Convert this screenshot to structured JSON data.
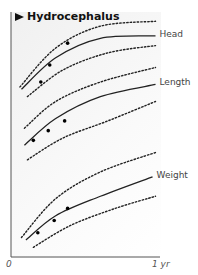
{
  "chart_data": {
    "type": "line",
    "title": "Hydrocephalus",
    "xlabel": "",
    "ylabel": "",
    "xlim": [
      0,
      1
    ],
    "ylim": [
      0,
      100
    ],
    "x_ticks": [
      "0",
      "1 yr"
    ],
    "grid": false,
    "series": [
      {
        "name": "Head",
        "label": "Head",
        "median": [
          [
            0.07,
            69
          ],
          [
            0.3,
            82
          ],
          [
            0.6,
            90
          ],
          [
            0.97,
            91
          ]
        ],
        "upper": [
          [
            0.06,
            70
          ],
          [
            0.3,
            86
          ],
          [
            0.6,
            95
          ],
          [
            0.97,
            97
          ]
        ],
        "lower": [
          [
            0.11,
            66
          ],
          [
            0.35,
            77
          ],
          [
            0.65,
            84
          ],
          [
            0.97,
            87
          ]
        ],
        "points": [
          [
            0.2,
            72
          ],
          [
            0.26,
            79
          ],
          [
            0.38,
            88
          ]
        ]
      },
      {
        "name": "Length",
        "label": "Length",
        "median": [
          [
            0.09,
            46
          ],
          [
            0.3,
            57
          ],
          [
            0.6,
            66
          ],
          [
            0.97,
            71
          ]
        ],
        "upper": [
          [
            0.09,
            53
          ],
          [
            0.3,
            64
          ],
          [
            0.6,
            72
          ],
          [
            0.97,
            78
          ]
        ],
        "lower": [
          [
            0.11,
            40
          ],
          [
            0.35,
            49
          ],
          [
            0.65,
            56
          ],
          [
            0.97,
            64
          ]
        ],
        "points": [
          [
            0.15,
            48
          ],
          [
            0.25,
            52
          ],
          [
            0.36,
            56
          ]
        ]
      },
      {
        "name": "Weight",
        "label": "Weight",
        "median": [
          [
            0.1,
            7
          ],
          [
            0.3,
            17
          ],
          [
            0.6,
            25
          ],
          [
            0.95,
            33
          ]
        ],
        "upper": [
          [
            0.07,
            8
          ],
          [
            0.3,
            24
          ],
          [
            0.6,
            35
          ],
          [
            0.97,
            43
          ]
        ],
        "lower": [
          [
            0.15,
            4
          ],
          [
            0.4,
            13
          ],
          [
            0.7,
            20
          ],
          [
            0.97,
            25
          ]
        ],
        "points": [
          [
            0.18,
            10
          ],
          [
            0.29,
            15
          ],
          [
            0.38,
            20
          ]
        ]
      }
    ]
  }
}
